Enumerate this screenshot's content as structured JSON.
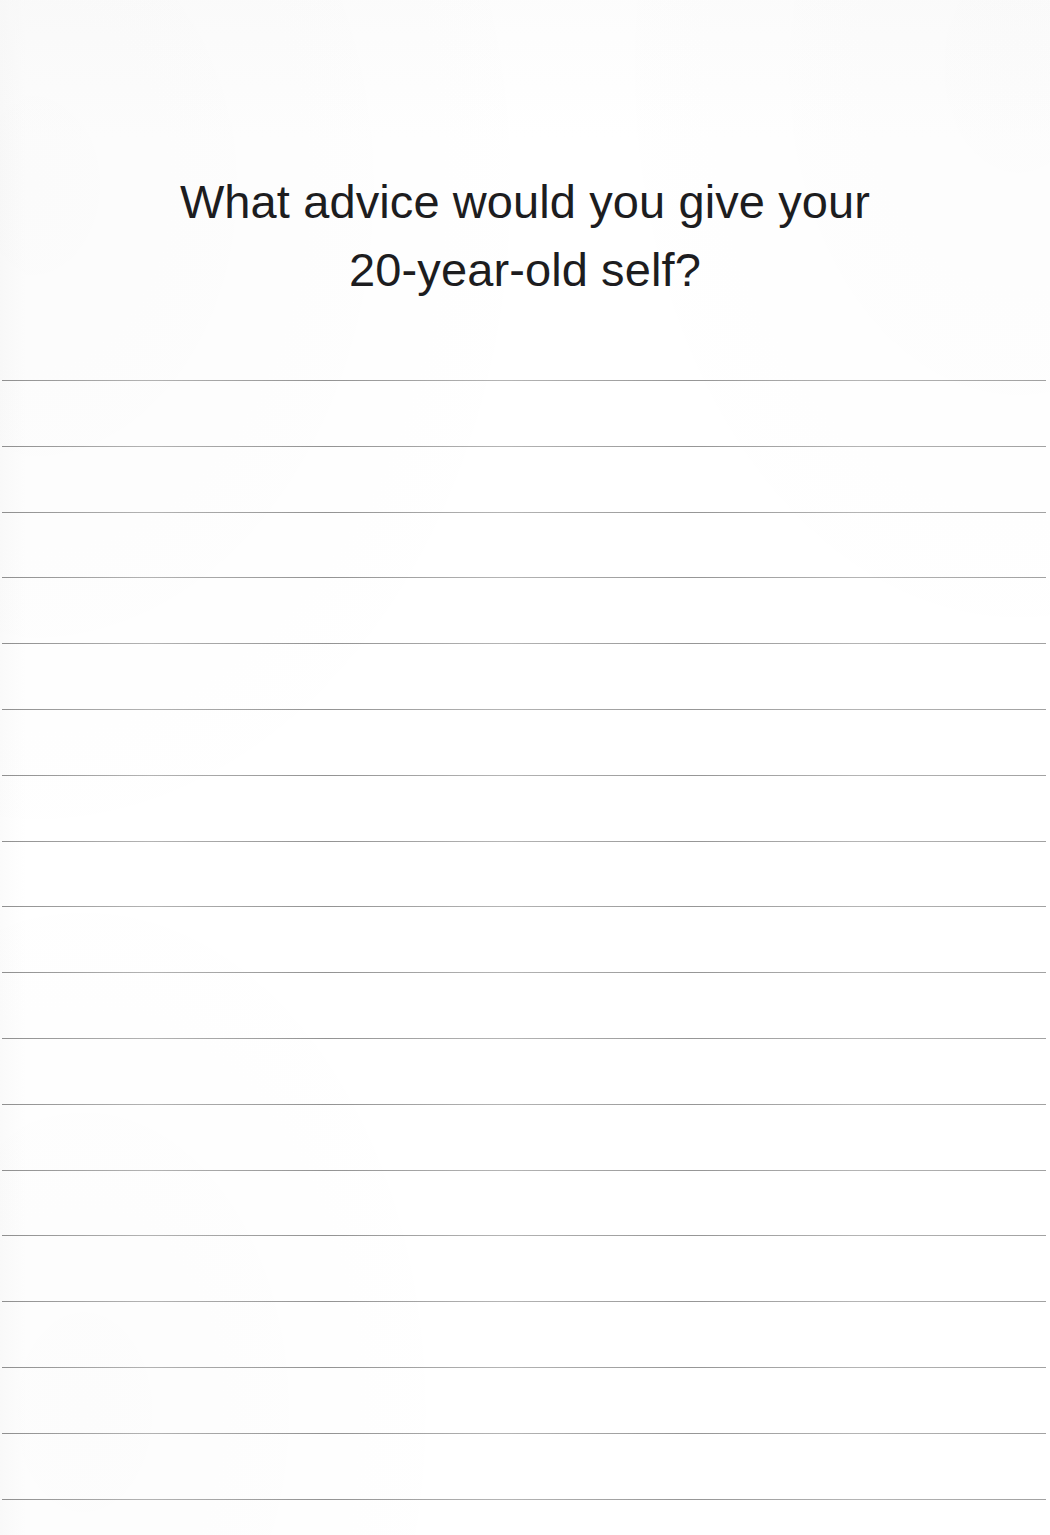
{
  "document": {
    "type": "journal-prompt-page",
    "background_color": "#ffffff",
    "text_color": "#1d1d1f",
    "rule_color": "#a9a9a9",
    "page_width": 1050,
    "page_height": 1535
  },
  "prompt": {
    "full_text": "What advice would you give your 20-year-old self?",
    "lines": [
      "What advice would you give your",
      "20-year-old self?"
    ]
  },
  "writing_area": {
    "label": "lined writing area",
    "line_count": 18,
    "first_line_y": 380,
    "line_spacing": 65.8,
    "line_left": 2,
    "line_width": 1044,
    "lines": [
      {
        "index": 1,
        "y": 380
      },
      {
        "index": 2,
        "y": 446
      },
      {
        "index": 3,
        "y": 512
      },
      {
        "index": 4,
        "y": 577
      },
      {
        "index": 5,
        "y": 643
      },
      {
        "index": 6,
        "y": 709
      },
      {
        "index": 7,
        "y": 775
      },
      {
        "index": 8,
        "y": 841
      },
      {
        "index": 9,
        "y": 906
      },
      {
        "index": 10,
        "y": 972
      },
      {
        "index": 11,
        "y": 1038
      },
      {
        "index": 12,
        "y": 1104
      },
      {
        "index": 13,
        "y": 1170
      },
      {
        "index": 14,
        "y": 1235
      },
      {
        "index": 15,
        "y": 1301
      },
      {
        "index": 16,
        "y": 1367
      },
      {
        "index": 17,
        "y": 1433
      },
      {
        "index": 18,
        "y": 1499
      }
    ]
  }
}
